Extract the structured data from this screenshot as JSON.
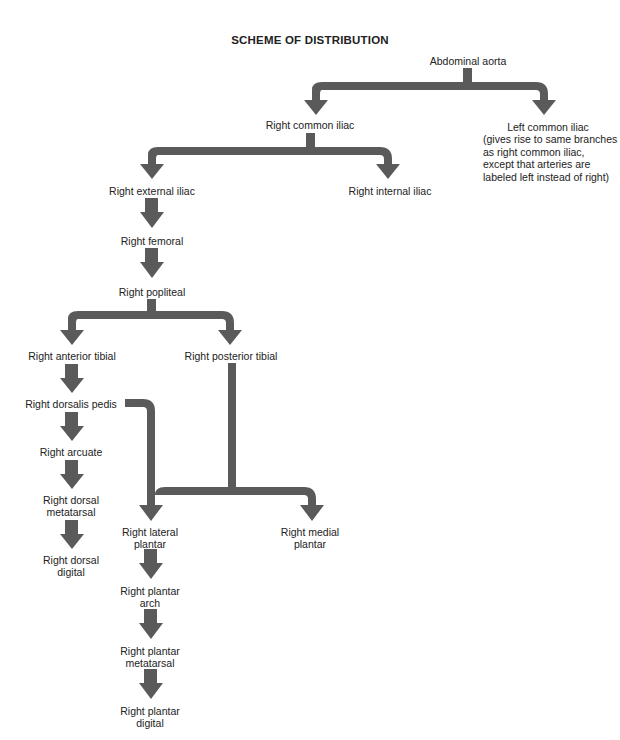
{
  "title": "SCHEME OF DISTRIBUTION",
  "colors": {
    "arrow": "#5a5a5a",
    "text": "#222222",
    "background": "#ffffff"
  },
  "nodes": {
    "abdominal_aorta": "Abdominal aorta",
    "left_common_iliac": "Left common iliac",
    "left_common_iliac_note": "(gives rise to same branches as right common iliac, except that arteries are labeled left instead of right)",
    "right_common_iliac": "Right common iliac",
    "right_external_iliac": "Right external iliac",
    "right_internal_iliac": "Right internal iliac",
    "right_femoral": "Right femoral",
    "right_popliteal": "Right popliteal",
    "right_anterior_tibial": "Right anterior tibial",
    "right_posterior_tibial": "Right posterior tibial",
    "right_dorsalis_pedis": "Right dorsalis pedis",
    "right_arcuate": "Right arcuate",
    "right_dorsal_metatarsal_1": "Right dorsal",
    "right_dorsal_metatarsal_2": "metatarsal",
    "right_dorsal_digital_1": "Right dorsal",
    "right_dorsal_digital_2": "digital",
    "right_lateral_plantar_1": "Right lateral",
    "right_lateral_plantar_2": "plantar",
    "right_medial_plantar_1": "Right medial",
    "right_medial_plantar_2": "plantar",
    "right_plantar_arch_1": "Right plantar",
    "right_plantar_arch_2": "arch",
    "right_plantar_metatarsal_1": "Right plantar",
    "right_plantar_metatarsal_2": "metatarsal",
    "right_plantar_digital_1": "Right plantar",
    "right_plantar_digital_2": "digital"
  }
}
